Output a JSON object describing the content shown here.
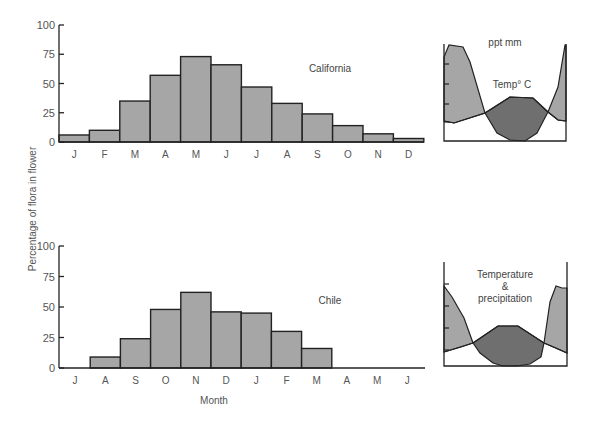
{
  "chart_data": [
    {
      "type": "bar",
      "title": "California",
      "categories": [
        "J",
        "F",
        "M",
        "A",
        "M",
        "J",
        "J",
        "A",
        "S",
        "O",
        "N",
        "D"
      ],
      "values": [
        6,
        10,
        35,
        57,
        73,
        66,
        47,
        33,
        24,
        14,
        7,
        3
      ],
      "xlabel": "",
      "ylabel": "Percentage of flora in flower",
      "ylim": [
        0,
        100
      ],
      "yticks": [
        0,
        25,
        50,
        75,
        100
      ],
      "grid": false,
      "inset": {
        "type": "area",
        "labels": [
          "ppt mm",
          "Temp° C"
        ],
        "series": [
          "precipitation",
          "temperature"
        ]
      }
    },
    {
      "type": "bar",
      "title": "Chile",
      "categories": [
        "J",
        "A",
        "S",
        "O",
        "N",
        "D",
        "J",
        "F",
        "M",
        "A",
        "M",
        "J"
      ],
      "values": [
        0,
        9,
        24,
        48,
        62,
        46,
        45,
        30,
        16,
        0,
        0,
        0
      ],
      "xlabel": "Month",
      "ylabel": "Percentage of flora in flower",
      "ylim": [
        0,
        100
      ],
      "yticks": [
        0,
        25,
        50,
        75,
        100
      ],
      "grid": false,
      "inset": {
        "type": "area",
        "labels": [
          "Temperature",
          "&",
          "precipitation"
        ],
        "series": [
          "precipitation",
          "temperature"
        ]
      }
    }
  ],
  "labels": {
    "y_axis": "Percentage of flora in flower",
    "x_axis": "Month",
    "california": "California",
    "chile": "Chile",
    "ppt": "ppt mm",
    "temp": "Temp° C",
    "temperature": "Temperature",
    "amp": "&",
    "precipitation": "precipitation",
    "ticks": [
      "0",
      "25",
      "50",
      "75",
      "100"
    ]
  },
  "colors": {
    "bar_fill": "#a6a6a6",
    "dark_fill": "#6f6f6f",
    "stroke": "#222222"
  }
}
